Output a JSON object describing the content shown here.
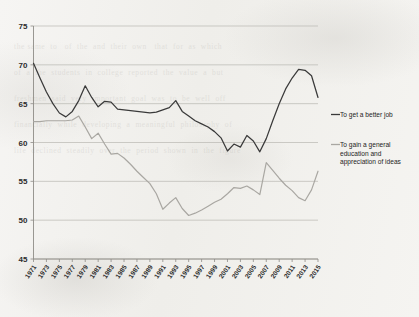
{
  "document": {
    "kind": "scanned-book-page",
    "background_color": "#f4f3f1",
    "ghost_text": "the same  to   of  the  and  their  own   that  for  as  which\nof  a  the  students  in  college  reported  the  value  a  but\nfreshmen  said  very  important  goal  was  to  be  well  off\nfinancially  while  developing  a  meaningful  philosophy  of\nlife  declined  steadily  over  the  period  shown  in  the  figure"
  },
  "chart_data": {
    "type": "line",
    "title": "",
    "subtitle": "",
    "xlabel": "",
    "ylabel": "",
    "grid": true,
    "legend_position": "right",
    "ylim": [
      45,
      75
    ],
    "yticks": [
      45,
      50,
      55,
      60,
      65,
      70,
      75
    ],
    "xlim": [
      1971,
      2015
    ],
    "xticks": [
      1971,
      1973,
      1975,
      1977,
      1979,
      1981,
      1983,
      1985,
      1987,
      1989,
      1991,
      1993,
      1995,
      1997,
      1999,
      2001,
      2003,
      2005,
      2007,
      2009,
      2011,
      2013,
      2015
    ],
    "xtick_labels": [
      "1971",
      "1973",
      "1975",
      "1977",
      "1979",
      "1981",
      "1983",
      "1985",
      "1987",
      "1989",
      "1991",
      "1993",
      "1995",
      "1997",
      "1999",
      "2001",
      "2003",
      "2005",
      "2007",
      "2009",
      "2011",
      "2013",
      "2015"
    ],
    "xtick_rotation": -55,
    "x": [
      1971,
      1972,
      1973,
      1974,
      1975,
      1976,
      1977,
      1978,
      1979,
      1980,
      1981,
      1982,
      1983,
      1984,
      1985,
      1986,
      1987,
      1988,
      1989,
      1990,
      1991,
      1992,
      1993,
      1994,
      1995,
      1996,
      1997,
      1998,
      1999,
      2000,
      2001,
      2002,
      2003,
      2004,
      2005,
      2006,
      2007,
      2008,
      2009,
      2010,
      2011,
      2012,
      2013,
      2014,
      2015
    ],
    "series": [
      {
        "name": "To get a better job",
        "color": "#3a3a3a",
        "values": [
          70.2,
          68.3,
          66.5,
          65.0,
          63.8,
          63.3,
          64.0,
          65.4,
          67.3,
          65.8,
          64.6,
          65.3,
          65.2,
          64.3,
          64.2,
          64.1,
          64.0,
          63.9,
          63.8,
          63.9,
          64.2,
          64.5,
          65.4,
          64.0,
          63.4,
          62.8,
          62.4,
          62.0,
          61.4,
          60.6,
          58.9,
          59.8,
          59.4,
          60.9,
          60.2,
          58.8,
          60.5,
          62.8,
          65.0,
          66.9,
          68.3,
          69.4,
          69.3,
          68.6,
          65.8
        ]
      },
      {
        "name": "To gain a general education and appreciation of ideas",
        "color": "#a9a7a2",
        "values": [
          62.7,
          62.7,
          62.8,
          62.8,
          62.8,
          62.8,
          62.9,
          63.4,
          62.0,
          60.5,
          61.2,
          59.8,
          58.5,
          58.6,
          58.0,
          57.2,
          56.3,
          55.5,
          54.7,
          53.4,
          51.4,
          52.2,
          52.9,
          51.5,
          50.6,
          50.9,
          51.3,
          51.8,
          52.3,
          52.7,
          53.4,
          54.2,
          54.1,
          54.4,
          53.9,
          53.3,
          57.4,
          56.4,
          55.4,
          54.5,
          53.8,
          52.9,
          52.5,
          53.9,
          56.3
        ]
      }
    ],
    "legend": [
      {
        "label": "To get a better job",
        "color": "#3a3a3a"
      },
      {
        "label": "To gain a general\neducation and\nappreciation of ideas",
        "color": "#a9a7a2"
      }
    ],
    "legend_lines": {
      "a": [
        "To get a better job"
      ],
      "b": [
        "To gain a general",
        "education and",
        "appreciation of ideas"
      ]
    }
  }
}
